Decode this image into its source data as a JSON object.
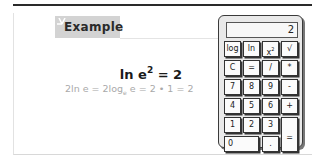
{
  "example_card": {
    "header_label": "Example",
    "formula": {
      "main_prefix": "ln e",
      "main_exponent": "2",
      "main_suffix": " = 2",
      "derivation_part1": "2ln e = 2log",
      "derivation_base": "e",
      "derivation_part2": " e = 2 • 1 = 2"
    }
  },
  "calculator": {
    "display_value": "2",
    "keys": {
      "row1": [
        "log",
        "ln",
        "x",
        "√"
      ],
      "x_squared_exponent": "2",
      "row2": [
        "C",
        "=",
        "/",
        "*"
      ],
      "row3": [
        "7",
        "8",
        "9",
        "-"
      ],
      "row4": [
        "4",
        "5",
        "6",
        "+"
      ],
      "row5": [
        "1",
        "2",
        "3"
      ],
      "row6": [
        "0",
        "."
      ],
      "equals": "="
    }
  },
  "colors": {
    "tab_background": "#d3d3d3",
    "derivation_text": "#a9a9a9",
    "calculator_body": "#e9e9e9"
  }
}
